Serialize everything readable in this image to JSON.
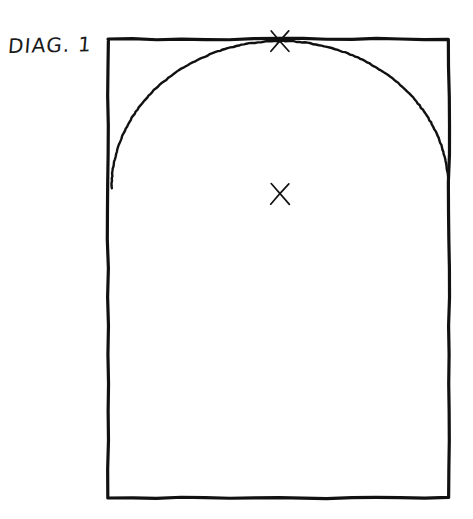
{
  "canvas": {
    "width": 473,
    "height": 519,
    "background_color": "#ffffff",
    "style": "hand-drawn pen sketch"
  },
  "label": {
    "text": "DIAG. 1",
    "x": 8,
    "y": 34,
    "color": "#1a1a1a",
    "font_size": 20
  },
  "figure": {
    "name": "arched-rectangle-diagram",
    "stroke_color": "#111111",
    "rectangle": {
      "name": "outer-rectangle",
      "x": 108,
      "y": 39,
      "width": 341,
      "height": 459,
      "stroke_width": 3.2
    },
    "arch": {
      "name": "arch-curve",
      "description": "semicircular arch spanning full rectangle width, apex tangent to top edge",
      "left_springing_x": 110,
      "right_springing_x": 447,
      "springing_y": 188,
      "apex_x": 280,
      "apex_y": 41,
      "stroke_width": 2.4
    },
    "marks": [
      {
        "name": "x-mark-apex",
        "label": "X",
        "x": 280,
        "y": 41,
        "size": 20,
        "stroke_width": 1.7
      },
      {
        "name": "x-mark-center",
        "label": "X",
        "x": 280,
        "y": 194,
        "size": 21,
        "stroke_width": 1.7
      }
    ]
  }
}
